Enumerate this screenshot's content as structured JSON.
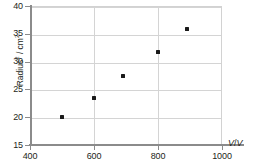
{
  "chart_data": {
    "type": "scatter",
    "title": "",
    "xlabel": "V / V",
    "ylabel": "Radius² / cm²",
    "xlim": [
      400,
      1000
    ],
    "ylim": [
      15,
      40
    ],
    "xticks": [
      400,
      600,
      800,
      1000
    ],
    "yticks": [
      15,
      20,
      25,
      30,
      35,
      40
    ],
    "xtick_labels": [
      "400",
      "600",
      "800",
      "1000"
    ],
    "ytick_labels": [
      "15",
      "20",
      "25",
      "30",
      "35",
      "40"
    ],
    "grid": true,
    "legend": false,
    "series": [
      {
        "name": "Radius squared vs voltage",
        "marker": "square",
        "color": "#1a1a1a",
        "points": [
          {
            "x": 500,
            "y": 20.0
          },
          {
            "x": 600,
            "y": 23.4
          },
          {
            "x": 690,
            "y": 27.4
          },
          {
            "x": 800,
            "y": 31.8
          },
          {
            "x": 890,
            "y": 35.8
          }
        ]
      }
    ]
  },
  "axis_label_parts": {
    "y_base": "Radius",
    "y_sup1": "2",
    "y_mid": " / cm",
    "y_sup2": "2",
    "x_quantity": "V",
    "x_sep": "/",
    "x_unit": "V"
  },
  "colors": {
    "marker": "#1a1a1a",
    "grid": "#d4d4d4",
    "axis": "#8b8b8b",
    "text": "#231f20",
    "background": "#ffffff"
  }
}
